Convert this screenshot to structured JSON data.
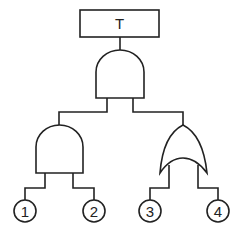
{
  "diagram": {
    "type": "fault-tree",
    "top_event": {
      "label": "T"
    },
    "gates": [
      {
        "id": "top",
        "type": "AND"
      },
      {
        "id": "left",
        "type": "AND"
      },
      {
        "id": "right",
        "type": "OR"
      }
    ],
    "basic_events": [
      {
        "label": "1"
      },
      {
        "label": "2"
      },
      {
        "label": "3"
      },
      {
        "label": "4"
      }
    ],
    "colors": {
      "stroke": "#222222",
      "background": "#ffffff"
    }
  }
}
